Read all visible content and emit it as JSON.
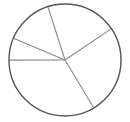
{
  "chart_data": {
    "type": "pie",
    "title": "",
    "categories": [
      "Slice A",
      "Slice B",
      "Slice C",
      "Slice D",
      "Slice E"
    ],
    "values": [
      20.5,
      25.9,
      33.6,
      6.4,
      13.7
    ],
    "start_angle_deg": 342.2,
    "direction": "clockwise",
    "legend": "none",
    "labels_visible": false,
    "fill_color": "#ffffff",
    "outline_color": "#555555",
    "spoke_color": "#888888"
  },
  "geometry": {
    "cx": 65,
    "cy": 60,
    "r": 56
  }
}
